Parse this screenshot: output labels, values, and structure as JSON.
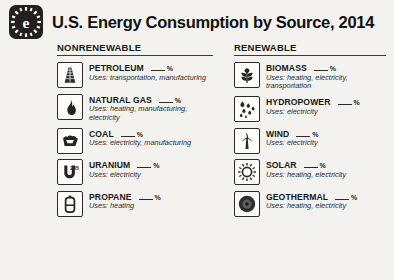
{
  "header": {
    "logo_icon": "sun-e-logo-icon",
    "title": "U.S. Energy Consumption by Source, 2014"
  },
  "columns": [
    {
      "id": "nonrenewable",
      "heading": "NONRENEWABLE",
      "sources": [
        {
          "name": "PETROLEUM",
          "icon": "oil-derrick-icon",
          "percent_value": "",
          "percent_symbol": "%",
          "uses": "Uses: transportation, manufacturing"
        },
        {
          "name": "NATURAL GAS",
          "icon": "flame-icon",
          "percent_value": "",
          "percent_symbol": "%",
          "uses": "Uses: heating, manufacturing, electricity"
        },
        {
          "name": "COAL",
          "icon": "coal-lump-icon",
          "percent_value": "",
          "percent_symbol": "%",
          "uses": "Uses: electricity, manufacturing"
        },
        {
          "name": "URANIUM",
          "icon": "uranium-235-icon",
          "percent_value": "",
          "percent_symbol": "%",
          "uses": "Uses: electricity"
        },
        {
          "name": "PROPANE",
          "icon": "propane-tank-icon",
          "percent_value": "",
          "percent_symbol": "%",
          "uses": "Uses: heating"
        }
      ]
    },
    {
      "id": "renewable",
      "heading": "RENEWABLE",
      "sources": [
        {
          "name": "BIOMASS",
          "icon": "plant-leaves-icon",
          "percent_value": "",
          "percent_symbol": "%",
          "uses": "Uses: heating, electricity, transportation"
        },
        {
          "name": "HYDROPOWER",
          "icon": "water-droplets-icon",
          "percent_value": "",
          "percent_symbol": "%",
          "uses": "Uses: electricity"
        },
        {
          "name": "WIND",
          "icon": "wind-turbine-icon",
          "percent_value": "",
          "percent_symbol": "%",
          "uses": "Uses: electricity"
        },
        {
          "name": "SOLAR",
          "icon": "sun-icon",
          "percent_value": "",
          "percent_symbol": "%",
          "uses": "Uses: heating, electricity"
        },
        {
          "name": "GEOTHERMAL",
          "icon": "earth-cross-section-icon",
          "percent_value": "",
          "percent_symbol": "%",
          "uses": "Uses: heating, electricity"
        }
      ]
    }
  ]
}
